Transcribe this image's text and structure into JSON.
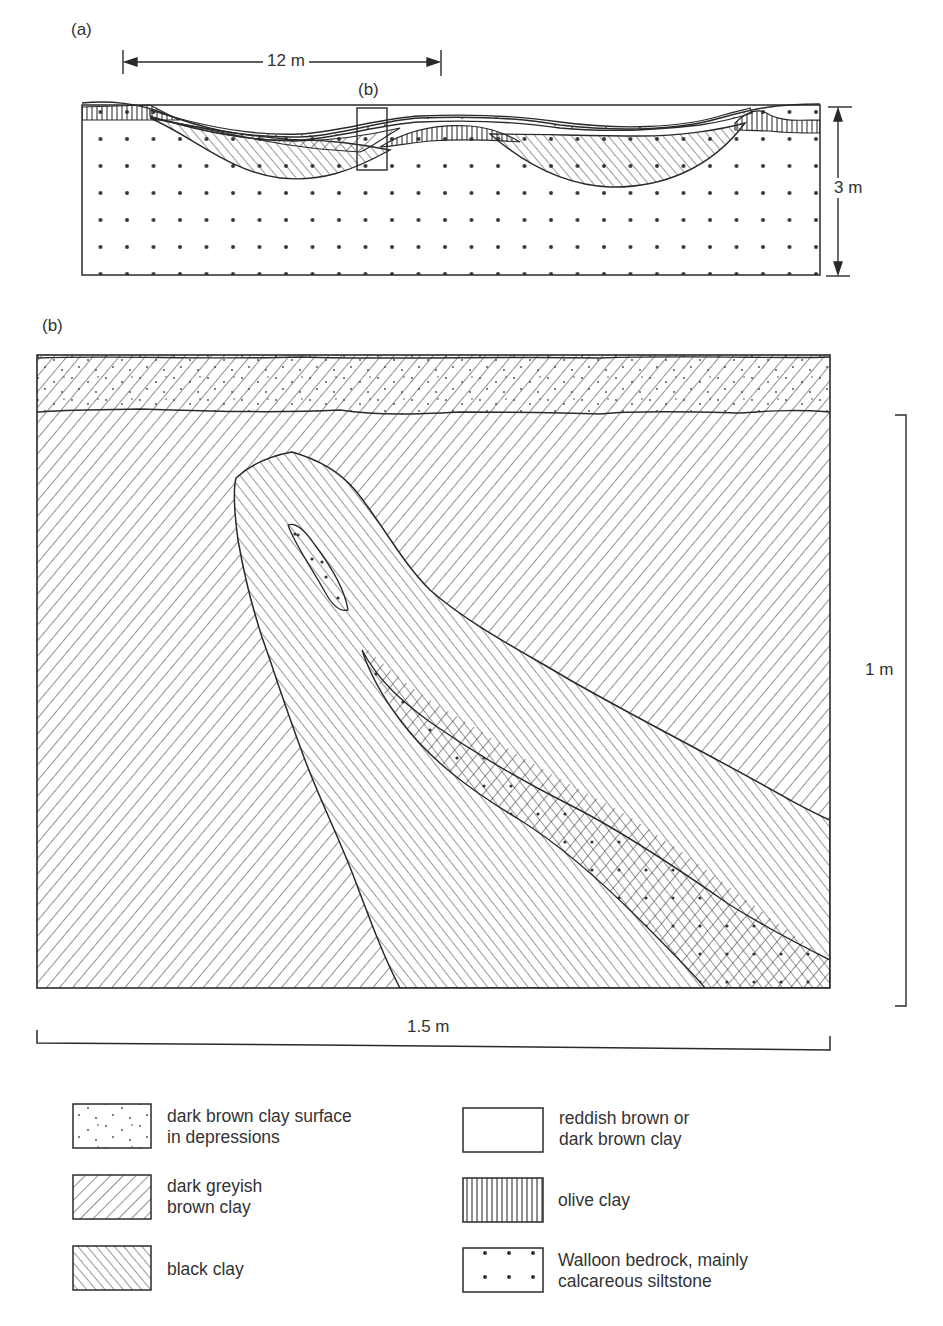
{
  "figure": {
    "panel_a": {
      "label": "(a)",
      "width_dimension": "12 m",
      "height_dimension": "3 m",
      "inset_box_label": "(b)"
    },
    "panel_b": {
      "label": "(b)",
      "height_scale": "1 m",
      "width_scale": "1.5 m"
    }
  },
  "legend": {
    "items": [
      {
        "pattern": "fine-dots",
        "text": "dark brown clay surface\nin depressions"
      },
      {
        "pattern": "forward-hatch",
        "text": "dark greyish\nbrown clay"
      },
      {
        "pattern": "back-hatch",
        "text": "black clay"
      },
      {
        "pattern": "blank",
        "text": "reddish brown or\ndark brown clay"
      },
      {
        "pattern": "vertical-lines",
        "text": "olive clay"
      },
      {
        "pattern": "coarse-dots",
        "text": "Walloon bedrock, mainly\ncalcareous siltstone"
      }
    ]
  },
  "colors": {
    "ink": "#2a2a2a",
    "paper": "#ffffff"
  }
}
